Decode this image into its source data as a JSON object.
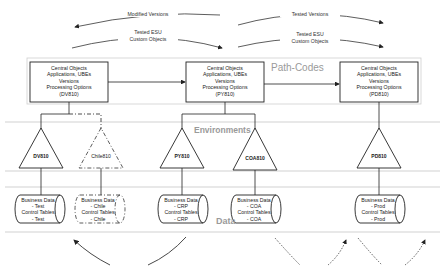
{
  "diagram": {
    "top_arrows": [
      {
        "label": "Modified Versions",
        "direction": "right-to-left"
      },
      {
        "label_line1": "Tested ESU",
        "label_line2": "Custom Objects",
        "direction": "left-to-right"
      },
      {
        "label": "Tested Versions",
        "direction": "left-to-right"
      },
      {
        "label_line1": "Tested ESU",
        "label_line2": "Custom Objects",
        "direction": "left-to-right"
      }
    ],
    "bands": {
      "path_codes": "Path-Codes",
      "environments": "Environments",
      "data": "Data"
    },
    "path_code_boxes": [
      {
        "lines": [
          "Central Objects",
          "Applications, UBEs",
          "Versions",
          "Processing Options",
          "(DV810)"
        ]
      },
      {
        "lines": [
          "Central Objects",
          "Applications, UBEs",
          "Versions",
          "Processing Options",
          "(PY810)"
        ]
      },
      {
        "lines": [
          "Central Objects",
          "Applications, UBEs",
          "Versions",
          "Processing Options",
          "(PD810)"
        ]
      }
    ],
    "environments": [
      {
        "name": "DV810",
        "style": "solid"
      },
      {
        "name": "Chile810",
        "style": "dashed"
      },
      {
        "name": "PY810",
        "style": "solid"
      },
      {
        "name": "COA810",
        "style": "solid"
      },
      {
        "name": "PD810",
        "style": "solid"
      }
    ],
    "data_sources": [
      {
        "lines": [
          "Business Data",
          "- Test",
          "Control Tables",
          "- Test"
        ],
        "style": "solid"
      },
      {
        "lines": [
          "Business Data",
          "- Chile",
          "Control Tables",
          "- Chile"
        ],
        "style": "dashed"
      },
      {
        "lines": [
          "Business Data",
          "- CRP",
          "Control Tables",
          "- CRP"
        ],
        "style": "solid"
      },
      {
        "lines": [
          "Business Data",
          "- COA",
          "Control Tables",
          "- COA"
        ],
        "style": "solid"
      },
      {
        "lines": [
          "Business Data",
          "- Prod",
          "Control Tables",
          "- Prod"
        ],
        "style": "solid"
      }
    ],
    "colors": {
      "line": "#222222",
      "band_line": "#bdbdbd",
      "band_label": "#9a9a9a"
    }
  }
}
